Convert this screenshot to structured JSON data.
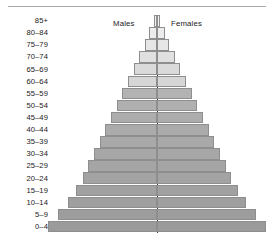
{
  "chart_data": {
    "type": "bar",
    "title": "",
    "subtitle": "",
    "xlabel": "",
    "ylabel": "",
    "orientation": "horizontal",
    "layout": "population-pyramid",
    "grid": false,
    "legend_position": "top-inline",
    "axis_center_label": "",
    "categories": [
      "85+",
      "80–84",
      "75–79",
      "70–74",
      "65–69",
      "60–64",
      "55–59",
      "50–54",
      "45–49",
      "40–44",
      "35–39",
      "30–34",
      "25–29",
      "20–24",
      "15–19",
      "10–14",
      "5–9",
      "0–4"
    ],
    "series": [
      {
        "name": "Males",
        "side": "left",
        "values": [
          0.35,
          0.8,
          1.3,
          1.9,
          2.5,
          3.1,
          3.7,
          4.3,
          4.9,
          5.5,
          6.1,
          6.7,
          7.3,
          7.9,
          8.6,
          9.5,
          10.5,
          11.6
        ]
      },
      {
        "name": "Females",
        "side": "right",
        "values": [
          0.35,
          0.8,
          1.3,
          1.9,
          2.5,
          3.1,
          3.7,
          4.3,
          4.9,
          5.5,
          6.1,
          6.7,
          7.3,
          7.9,
          8.6,
          9.5,
          10.5,
          11.6
        ]
      }
    ],
    "xlim": [
      -12,
      12
    ],
    "bar_shades": [
      "#f2f2f2",
      "#ececec",
      "#e6e6e6",
      "#e0e0e0",
      "#dadada",
      "#d6d6d6",
      "#b3b3b3",
      "#b0b0b0",
      "#adadad",
      "#ababab",
      "#a9a9a9",
      "#a7a7a7",
      "#a5a5a5",
      "#a3a3a3",
      "#a1a1a1",
      "#9f9f9f",
      "#9d9d9d",
      "#9b9b9b"
    ],
    "annotations": []
  },
  "legend": {
    "males": "Males",
    "females": "Females"
  },
  "colors": {
    "bar_border": "#8e8e8e",
    "center_line": "#3a3a4a",
    "top_rule": "#a9a9a9",
    "text": "#1a1a1a",
    "background": "#ffffff"
  }
}
